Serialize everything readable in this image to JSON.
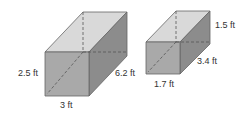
{
  "figure": {
    "colors": {
      "front_face": "#a9a9a9",
      "top_face": "#d9d9d9",
      "side_face": "#8c8c8c",
      "edge": "#666666",
      "label": "#333333"
    },
    "prisms": [
      {
        "name": "large-prism",
        "labels": {
          "height": "2.5 ft",
          "width": "3 ft",
          "depth": "6.2 ft"
        }
      },
      {
        "name": "small-prism",
        "labels": {
          "height": "1.5 ft",
          "width": "1.7 ft",
          "depth": "3.4 ft"
        }
      }
    ]
  }
}
